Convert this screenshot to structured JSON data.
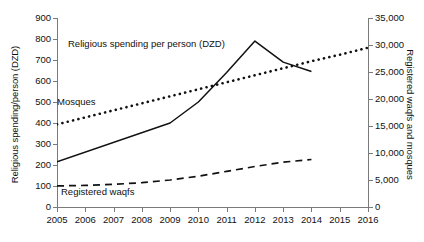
{
  "chart_data": {
    "type": "line",
    "title": "",
    "xlabel": "",
    "x": [
      2005,
      2006,
      2007,
      2008,
      2009,
      2010,
      2011,
      2012,
      2013,
      2014,
      2015,
      2016
    ],
    "x_tick_labels": [
      "2005",
      "2006",
      "2007",
      "2008",
      "2009",
      "2010",
      "2011",
      "2012",
      "2013",
      "2014",
      "2015",
      "2016"
    ],
    "grid": false,
    "legend_position": "inline-annotations",
    "axes": {
      "left": {
        "label": "Religious spending/person (DZD)",
        "min": 0,
        "max": 900,
        "step": 100,
        "tick_labels": [
          "900",
          "800",
          "700",
          "600",
          "500",
          "400",
          "300",
          "200",
          "100",
          "0"
        ]
      },
      "right": {
        "label": "Registered waqfs and mosques",
        "min": 0,
        "max": 35000,
        "step": 5000,
        "tick_labels": [
          "35,000",
          "30,000",
          "25,000",
          "20,000",
          "15,000",
          "10,000",
          "5,000",
          "0"
        ]
      }
    },
    "series": [
      {
        "name": "Religious spending per person (DZD)",
        "axis": "left",
        "style": "solid",
        "annotation": "Religious spending per person (DZD)",
        "x": [
          2005,
          2009,
          2010,
          2011,
          2012,
          2013,
          2014
        ],
        "values": [
          215,
          400,
          500,
          640,
          790,
          690,
          645
        ]
      },
      {
        "name": "Mosques",
        "axis": "right",
        "style": "dotted",
        "annotation": "Mosques",
        "x": [
          2005,
          2006,
          2007,
          2008,
          2009,
          2010,
          2011,
          2012,
          2013,
          2014,
          2015,
          2016
        ],
        "values": [
          15300,
          16600,
          17900,
          19200,
          20500,
          21800,
          23100,
          24400,
          25700,
          27000,
          28200,
          29500
        ]
      },
      {
        "name": "Registered waqfs",
        "axis": "right",
        "style": "dashed",
        "annotation": "Registered waqfs",
        "x": [
          2005,
          2006,
          2007,
          2008,
          2009,
          2010,
          2011,
          2012,
          2013,
          2014
        ],
        "values": [
          3900,
          4000,
          4200,
          4500,
          5000,
          5700,
          6600,
          7500,
          8300,
          8800
        ]
      }
    ]
  },
  "annotations": {
    "spending": "Religious spending per person (DZD)",
    "mosques": "Mosques",
    "waqfs": "Registered waqfs"
  },
  "colors": {
    "line": "#111111",
    "axis": "#7a7a7a",
    "background": "#ffffff"
  }
}
